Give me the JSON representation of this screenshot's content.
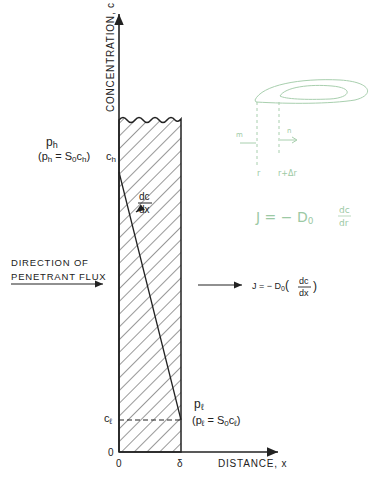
{
  "diagram": {
    "type": "membrane-permeation-concentration-profile",
    "y_axis": {
      "label": "CONCENTRATION, c",
      "origin_label": "0"
    },
    "x_axis": {
      "label": "DISTANCE, x",
      "tick_labels": [
        "0",
        "δ"
      ]
    },
    "upstream": {
      "pressure_label": "p_h",
      "pressure_text": "p",
      "pressure_sub": "h",
      "henry_text": "(p",
      "henry_sub1": "h",
      "henry_eq": " = S",
      "henry_sub2": "0",
      "henry_c": "c",
      "henry_sub3": "h",
      "henry_close": ")",
      "conc_label": "c",
      "conc_sub": "h"
    },
    "downstream": {
      "pressure_text": "p",
      "pressure_sub": "ℓ",
      "henry_text": "(p",
      "henry_sub1": "ℓ",
      "henry_eq": " = S",
      "henry_sub2": "0",
      "henry_c": "c",
      "henry_sub3": "ℓ",
      "henry_close": ")",
      "conc_label": "c",
      "conc_sub": "ℓ"
    },
    "gradient_label": {
      "num": "dc",
      "den": "dx"
    },
    "flux_direction": {
      "line1": "DIRECTION OF",
      "line2": "PENETRANT FLUX"
    },
    "fick_law": {
      "lhs": "J = − D",
      "sub": "0",
      "open": "(",
      "num": "dc",
      "den": "dx",
      "close": ")"
    },
    "handwritten": {
      "equation": {
        "lhs": "J = − D",
        "sub": "0",
        "num": "dc",
        "den": "dr"
      },
      "labels": {
        "in": "m",
        "out": "n",
        "r": "r",
        "r_dr": "r+Δr"
      }
    },
    "colors": {
      "ink": "#222222",
      "hatch": "#333333",
      "pencil": "#9cc9a4"
    }
  }
}
